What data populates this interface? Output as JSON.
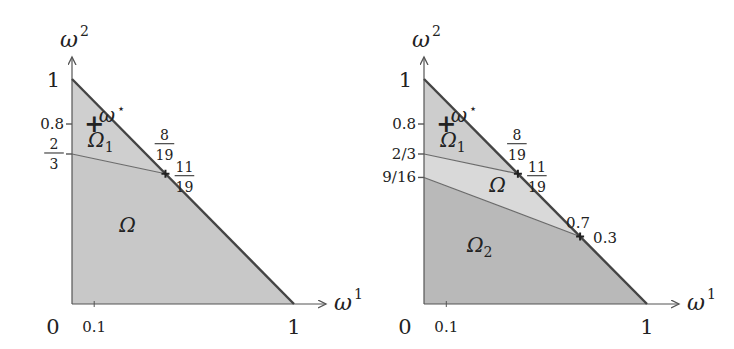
{
  "figure": {
    "panels": [
      {
        "id": "left",
        "x_axis_label": "ω",
        "x_axis_sup": "1",
        "y_axis_label": "ω",
        "y_axis_sup": "2",
        "origin_label": "0",
        "x_ticks": [
          {
            "value": 0.1,
            "label": "0.1"
          },
          {
            "value": 1,
            "label": "1"
          }
        ],
        "y_ticks": [
          {
            "value": 1,
            "label": "1"
          },
          {
            "value": 0.8,
            "label": "0.8"
          },
          {
            "value": 0.6667,
            "label_num": "2",
            "label_den": "3",
            "fraction": true
          }
        ],
        "frontier_label": "ω",
        "frontier_sup": "⋆",
        "reference_point": {
          "x": 0.1,
          "y": 0.8,
          "marker": "+"
        },
        "regions": [
          {
            "name": "Ω",
            "sub": "1",
            "vertices": [
              [
                0,
                1
              ],
              [
                0.421,
                0.579
              ],
              [
                0,
                0.6667
              ]
            ],
            "shade": "#cfcfcf"
          },
          {
            "name": "Ω",
            "sub": "",
            "vertices": [
              [
                0,
                0.6667
              ],
              [
                0.421,
                0.579
              ],
              [
                1,
                0
              ],
              [
                0,
                0
              ]
            ],
            "shade": "#c8c8c8"
          }
        ],
        "region_labels": [
          {
            "text": "Ω",
            "sub": "1",
            "x": 0.13,
            "y": 0.7
          },
          {
            "text": "Ω",
            "sub": "",
            "x": 0.25,
            "y": 0.32
          }
        ],
        "dividers": [
          {
            "from": [
              0,
              0.6667
            ],
            "to": [
              0.421,
              0.579
            ]
          }
        ],
        "intersections": [
          {
            "x": 0.421,
            "y": 0.579,
            "x_label_num": "8",
            "x_label_den": "19",
            "y_label_num": "11",
            "y_label_den": "19"
          }
        ]
      },
      {
        "id": "right",
        "x_axis_label": "ω",
        "x_axis_sup": "1",
        "y_axis_label": "ω",
        "y_axis_sup": "2",
        "origin_label": "0",
        "x_ticks": [
          {
            "value": 0.1,
            "label": "0.1"
          },
          {
            "value": 1,
            "label": "1"
          }
        ],
        "y_ticks": [
          {
            "value": 1,
            "label": "1"
          },
          {
            "value": 0.8,
            "label": "0.8"
          },
          {
            "value": 0.6667,
            "label": "2/3"
          },
          {
            "value": 0.5625,
            "label": "9/16"
          }
        ],
        "frontier_label": "ω",
        "frontier_sup": "⋆",
        "reference_point": {
          "x": 0.1,
          "y": 0.8,
          "marker": "+"
        },
        "regions": [
          {
            "name": "Ω",
            "sub": "1",
            "vertices": [
              [
                0,
                1
              ],
              [
                0.421,
                0.579
              ],
              [
                0,
                0.6667
              ]
            ],
            "shade": "#cdcdcd"
          },
          {
            "name": "Ω",
            "sub": "",
            "vertices": [
              [
                0,
                0.6667
              ],
              [
                0.421,
                0.579
              ],
              [
                0.7,
                0.3
              ],
              [
                0,
                0.5625
              ]
            ],
            "shade": "#d9d9d9"
          },
          {
            "name": "Ω",
            "sub": "2",
            "vertices": [
              [
                0,
                0.5625
              ],
              [
                0.7,
                0.3
              ],
              [
                1,
                0
              ],
              [
                0,
                0
              ]
            ],
            "shade": "#b9b9b9"
          }
        ],
        "region_labels": [
          {
            "text": "Ω",
            "sub": "1",
            "x": 0.13,
            "y": 0.7
          },
          {
            "text": "Ω",
            "sub": "",
            "x": 0.33,
            "y": 0.5
          },
          {
            "text": "Ω",
            "sub": "2",
            "x": 0.25,
            "y": 0.23
          }
        ],
        "dividers": [
          {
            "from": [
              0,
              0.6667
            ],
            "to": [
              0.421,
              0.579
            ]
          },
          {
            "from": [
              0,
              0.5625
            ],
            "to": [
              0.7,
              0.3
            ]
          }
        ],
        "intersections": [
          {
            "x": 0.421,
            "y": 0.579,
            "x_label_num": "8",
            "x_label_den": "19",
            "y_label_num": "11",
            "y_label_den": "19"
          },
          {
            "x": 0.7,
            "y": 0.3,
            "x_label": "0.7",
            "y_label": "0.3"
          }
        ]
      }
    ],
    "colors": {
      "axis": "#555555",
      "frontier": "#444444",
      "divider": "#6a6a6a",
      "text": "#222222"
    }
  }
}
